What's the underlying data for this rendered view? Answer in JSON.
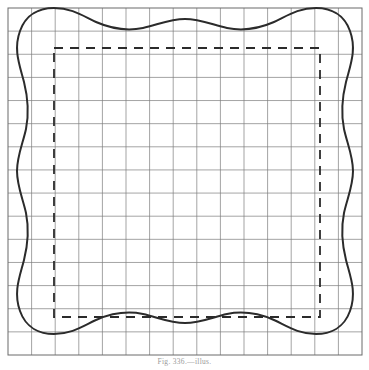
{
  "figure": {
    "caption": "Fig. 336.—illus."
  },
  "colors": {
    "background": "#ffffff",
    "grid_line": "#7d7d7d",
    "grid_border": "#6a6a6a",
    "outline_curve": "#2b2b2b",
    "dashed_rect": "#2b2b2b",
    "caption_text": "#9a9a9a"
  },
  "grid": {
    "label": "construction-grid",
    "x_start": 8,
    "y_start": 8,
    "x_end": 362,
    "y_end": 355,
    "columns": 15,
    "rows": 15,
    "cell_width": 23.6,
    "cell_height": 23.13,
    "line_width": 0.7,
    "border_width": 1.0
  },
  "dashed_rectangle": {
    "label": "inner-dashed-guide",
    "x": 54,
    "y": 48,
    "width": 266,
    "height": 269,
    "stroke_width": 1.8,
    "dash_pattern": "9 7"
  },
  "wavy_outline": {
    "label": "wavy-border-curve",
    "stroke_width": 2.0,
    "waves_per_side": 3,
    "amplitude": 12,
    "inset_min": 8,
    "inset_max": 20,
    "path": "M 20,31 C 26,14 40,8 54,8 C 72,8 83,16 96,22 C 112,29 128,31 143,28 C 157,25 170,19 185,19 C 200,19 213,25 227,28 C 242,31 258,29 274,22 C 287,16 298,8 316,8 C 330,8 344,14 350,31 C 357,50 350,66 346,82 C 342,98 341,114 344,129 C 347,143 353,156 353,171 C 353,186 347,199 344,213 C 341,228 342,244 346,260 C 350,276 357,292 350,311 C 344,328 330,334 316,334 C 298,334 287,326 274,320 C 258,313 242,311 227,314 C 213,317 200,323 185,323 C 170,323 157,317 143,314 C 128,311 112,313 96,320 C 83,326 72,334 54,334 C 40,334 26,328 20,311 C 13,292 20,276 24,260 C 28,244 29,228 26,213 C 23,199 17,186 17,171 C 17,156 23,143 26,129 C 29,114 28,98 24,82 C 20,66 13,50 20,31 Z"
  }
}
